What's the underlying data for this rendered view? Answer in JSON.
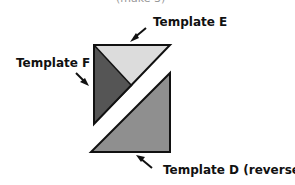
{
  "header": {
    "partial_text": "(make 3)"
  },
  "labels": {
    "template_e": "Template E",
    "template_f": "Template F",
    "template_d": "Template D (reversed)"
  },
  "colors": {
    "template_e_fill": "#dcdcdc",
    "template_f_fill": "#555555",
    "template_d_fill": "#8f8f8f",
    "outline": "#111111"
  }
}
